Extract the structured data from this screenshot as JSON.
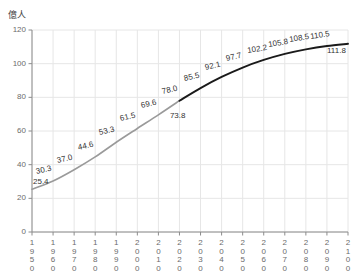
{
  "chart_data": {
    "type": "line",
    "title": "",
    "xlabel": "",
    "ylabel": "億人",
    "unit_label": "億人",
    "xlim": [
      1950,
      2100
    ],
    "ylim": [
      0,
      120
    ],
    "grid": true,
    "legend": "none",
    "y_ticks": [
      "0",
      "20",
      "40",
      "60",
      "80",
      "100",
      "120"
    ],
    "x_ticks": [
      "1950",
      "1960",
      "1970",
      "1980",
      "1990",
      "2000",
      "2010",
      "2020",
      "2030",
      "2040",
      "2050",
      "2060",
      "2070",
      "2080",
      "2090",
      "2100"
    ],
    "x": [
      1950,
      1960,
      1970,
      1980,
      1990,
      2000,
      2010,
      2020,
      2030,
      2040,
      2050,
      2060,
      2070,
      2080,
      2090,
      2100
    ],
    "values": [
      25.4,
      30.3,
      37.0,
      44.6,
      53.3,
      61.5,
      69.6,
      78.0,
      85.5,
      92.1,
      97.7,
      102.2,
      105.8,
      108.5,
      110.5,
      111.8
    ],
    "point_labels": [
      "25.4",
      "30.3",
      "37.0",
      "44.6",
      "53.3",
      "61.5",
      "69.6",
      "73.8",
      "78.0",
      "85.5",
      "92.1",
      "97.7",
      "102.2",
      "105.8",
      "108.5",
      "110.5",
      "111.8"
    ],
    "series": [
      {
        "name": "実績",
        "color": "#9a9a9a",
        "x": [
          1950,
          1960,
          1970,
          1980,
          1990,
          2000,
          2010,
          2020
        ],
        "values": [
          25.4,
          30.3,
          37.0,
          44.6,
          53.3,
          61.5,
          69.6,
          78.0
        ]
      },
      {
        "name": "推計",
        "color": "#1a1a1a",
        "x": [
          2020,
          2030,
          2040,
          2050,
          2060,
          2070,
          2080,
          2090,
          2100
        ],
        "values": [
          78.0,
          85.5,
          92.1,
          97.7,
          102.2,
          105.8,
          108.5,
          110.5,
          111.8
        ]
      }
    ],
    "annotations": [
      {
        "text": "25.4",
        "x": 1950,
        "y": 25.4,
        "placement": "above-left"
      },
      {
        "text": "30.3",
        "x": 1960,
        "y": 30.3,
        "placement": "above"
      },
      {
        "text": "37.0",
        "x": 1970,
        "y": 37.0,
        "placement": "above"
      },
      {
        "text": "44.6",
        "x": 1980,
        "y": 44.6,
        "placement": "above"
      },
      {
        "text": "53.3",
        "x": 1990,
        "y": 53.3,
        "placement": "above"
      },
      {
        "text": "61.5",
        "x": 2000,
        "y": 61.5,
        "placement": "above"
      },
      {
        "text": "69.6",
        "x": 2010,
        "y": 69.6,
        "placement": "above"
      },
      {
        "text": "73.8",
        "x": 2015,
        "y": 73.8,
        "placement": "below"
      },
      {
        "text": "78.0",
        "x": 2020,
        "y": 78.0,
        "placement": "above"
      },
      {
        "text": "85.5",
        "x": 2030,
        "y": 85.5,
        "placement": "above"
      },
      {
        "text": "92.1",
        "x": 2040,
        "y": 92.1,
        "placement": "above"
      },
      {
        "text": "97.7",
        "x": 2050,
        "y": 97.7,
        "placement": "above"
      },
      {
        "text": "102.2",
        "x": 2060,
        "y": 102.2,
        "placement": "above"
      },
      {
        "text": "105.8",
        "x": 2070,
        "y": 105.8,
        "placement": "above"
      },
      {
        "text": "108.5",
        "x": 2080,
        "y": 108.5,
        "placement": "above"
      },
      {
        "text": "110.5",
        "x": 2090,
        "y": 110.5,
        "placement": "above"
      },
      {
        "text": "111.8",
        "x": 2100,
        "y": 111.8,
        "placement": "below-left"
      }
    ],
    "colors": {
      "actual_line": "#9a9a9a",
      "projection_line": "#1a1a1a",
      "grid": "#e6e6e6",
      "axis": "#8c8c8c",
      "tick_text": "#6b6b6b",
      "label_text": "#333333",
      "background": "#ffffff"
    }
  }
}
